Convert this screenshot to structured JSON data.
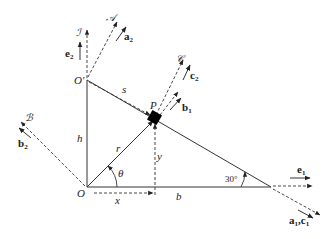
{
  "diagram": {
    "frames": {
      "I": {
        "label": "ℐ",
        "vector": "e",
        "vector_sub": "2"
      },
      "A": {
        "label": "𝒜",
        "vector": "a",
        "vector_sub": "2"
      },
      "B": {
        "label": "ℬ",
        "vector": "b",
        "vector_sub": "2"
      },
      "C": {
        "label": "𝒞",
        "vector": "c",
        "vector_sub": "2"
      }
    },
    "points": {
      "O": "O",
      "O_prime": "O′",
      "P": "P"
    },
    "lengths": {
      "s": "s",
      "h": "h",
      "r": "r",
      "y": "y",
      "x": "x",
      "b": "b"
    },
    "angles": {
      "theta": "θ",
      "incline": "30°"
    },
    "unit_vectors": {
      "b1": {
        "name": "b",
        "sub": "1"
      },
      "e1": {
        "name": "e",
        "sub": "1"
      },
      "a1c1": {
        "name": "a",
        "sub": "1",
        "sep": ",",
        "name2": "c",
        "sub2": "1"
      }
    }
  }
}
